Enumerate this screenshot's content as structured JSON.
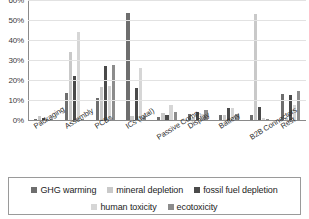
{
  "chart_data": {
    "type": "bar",
    "title": "",
    "xlabel": "",
    "ylabel": "",
    "ylim": [
      0,
      60
    ],
    "grid": true,
    "legend_position": "bottom",
    "y_tick_labels": [
      "60%",
      "50%",
      "40%",
      "30%",
      "20%",
      "10%",
      "0%"
    ],
    "y_ticks": [
      60,
      50,
      40,
      30,
      20,
      10,
      0
    ],
    "categories": [
      "Packaging",
      "Assembly",
      "PCBs",
      "ICs (total)",
      "Passive Comp.",
      "Display",
      "Battery",
      "B2B Connectors",
      "Rest"
    ],
    "series": [
      {
        "name": "GHG warming",
        "color": "#6e6e6e",
        "values": [
          0.5,
          13.5,
          10.8,
          53.5,
          1.7,
          3.0,
          2.3,
          2.3,
          12.8
        ]
      },
      {
        "name": "mineral depletion",
        "color": "#c9c9c9",
        "values": [
          2.2,
          33.8,
          16.5,
          2.0,
          3.3,
          1.5,
          2.5,
          53.0,
          1.0
        ]
      },
      {
        "name": "fossil fuel depletion",
        "color": "#4a4a4a",
        "values": [
          1.2,
          22.0,
          27.0,
          16.0,
          2.3,
          4.0,
          6.0,
          6.3,
          12.5
        ]
      },
      {
        "name": "human toxicity",
        "color": "#d6d6d6",
        "values": [
          0.3,
          43.8,
          16.8,
          26.0,
          7.5,
          3.2,
          6.2,
          0.8,
          7.5
        ]
      },
      {
        "name": "ecotoxicity",
        "color": "#8c8c8c",
        "values": [
          0.2,
          0.4,
          27.5,
          2.2,
          3.8,
          4.8,
          2.8,
          0.5,
          14.3
        ]
      }
    ]
  },
  "legend": {
    "rows": [
      [
        {
          "label": "GHG warming",
          "color": "#6e6e6e"
        },
        {
          "label": "mineral depletion",
          "color": "#c9c9c9"
        },
        {
          "label": "fossil fuel depletion",
          "color": "#4a4a4a"
        }
      ],
      [
        {
          "label": "human toxicity",
          "color": "#d6d6d6"
        },
        {
          "label": "ecotoxicity",
          "color": "#8c8c8c"
        }
      ]
    ]
  }
}
